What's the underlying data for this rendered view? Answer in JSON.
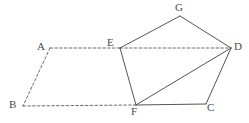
{
  "figure": {
    "name": "geometry-figure-parallelogram-pentagon",
    "width": 249,
    "height": 123,
    "background_color": "#ffffff",
    "stroke_color": "#555555",
    "dashed_stroke_color": "#6b6b6b",
    "label_color": "#4a4a4a",
    "stroke_width": 1
  },
  "points": {
    "A": {
      "label": "A",
      "x": 50,
      "y": 48,
      "label_x": 37,
      "label_y": 41
    },
    "B": {
      "label": "B",
      "x": 23,
      "y": 106,
      "label_x": 9,
      "label_y": 99
    },
    "C": {
      "label": "C",
      "x": 206,
      "y": 104,
      "label_x": 207,
      "label_y": 102
    },
    "D": {
      "label": "D",
      "x": 231,
      "y": 48,
      "label_x": 234,
      "label_y": 41
    },
    "E": {
      "label": "E",
      "x": 120,
      "y": 48,
      "label_x": 107,
      "label_y": 37
    },
    "F": {
      "label": "F",
      "x": 136,
      "y": 105,
      "label_x": 131,
      "label_y": 106
    },
    "G": {
      "label": "G",
      "x": 180,
      "y": 16,
      "label_x": 175,
      "label_y": 2
    }
  },
  "edges": [
    {
      "name": "edge-A-E",
      "from": "A",
      "to": "E",
      "style": "dashed"
    },
    {
      "name": "edge-A-B",
      "from": "A",
      "to": "B",
      "style": "dashed"
    },
    {
      "name": "edge-B-F",
      "from": "B",
      "to": "F",
      "style": "dashed"
    },
    {
      "name": "edge-E-D",
      "from": "E",
      "to": "D",
      "style": "dashed"
    },
    {
      "name": "edge-E-G",
      "from": "E",
      "to": "G",
      "style": "solid"
    },
    {
      "name": "edge-G-D",
      "from": "G",
      "to": "D",
      "style": "solid"
    },
    {
      "name": "edge-E-F",
      "from": "E",
      "to": "F",
      "style": "solid"
    },
    {
      "name": "edge-F-D",
      "from": "F",
      "to": "D",
      "style": "solid"
    },
    {
      "name": "edge-F-C",
      "from": "F",
      "to": "C",
      "style": "solid"
    },
    {
      "name": "edge-C-D",
      "from": "C",
      "to": "D",
      "style": "solid"
    }
  ]
}
